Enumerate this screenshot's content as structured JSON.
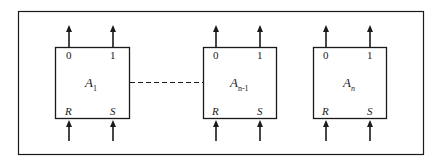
{
  "diagram": {
    "blocks": [
      {
        "name": "A",
        "subscript": "1",
        "sub_italic": false,
        "out_left": "0",
        "out_right": "1",
        "in_left": "R",
        "in_right": "S"
      },
      {
        "name": "A",
        "subscript": "n-1",
        "sub_italic": false,
        "out_left": "0",
        "out_right": "1",
        "in_left": "R",
        "in_right": "S"
      },
      {
        "name": "A",
        "subscript": "n",
        "sub_italic": true,
        "out_left": "0",
        "out_right": "1",
        "in_left": "R",
        "in_right": "S"
      }
    ],
    "connector": "dashed line between A1 and An-1",
    "colors": {
      "stroke": "#1a1a1a",
      "background": "#ffffff"
    }
  }
}
